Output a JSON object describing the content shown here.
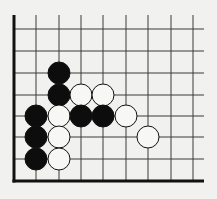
{
  "diagram": {
    "type": "go-board-corner",
    "background": "#f1f1ef",
    "line_color": "#3a3a3a",
    "border_color": "#111111",
    "grid": {
      "x_lines": [
        36,
        59,
        81,
        103,
        126,
        148,
        171,
        193
      ],
      "y_lines": [
        29,
        51,
        73,
        95,
        116,
        137,
        159
      ],
      "left_edge_x": 14,
      "bottom_edge_y": 181,
      "top_y": 15,
      "right_x": 204
    },
    "stone_radius": 11,
    "stones": [
      {
        "color": "black",
        "col": 2,
        "row": 3
      },
      {
        "color": "black",
        "col": 2,
        "row": 4
      },
      {
        "color": "white",
        "col": 3,
        "row": 4
      },
      {
        "color": "white",
        "col": 4,
        "row": 4
      },
      {
        "color": "black",
        "col": 1,
        "row": 5
      },
      {
        "color": "white",
        "col": 2,
        "row": 5
      },
      {
        "color": "black",
        "col": 3,
        "row": 5
      },
      {
        "color": "black",
        "col": 4,
        "row": 5
      },
      {
        "color": "white",
        "col": 5,
        "row": 5
      },
      {
        "color": "black",
        "col": 1,
        "row": 6
      },
      {
        "color": "white",
        "col": 2,
        "row": 6
      },
      {
        "color": "white",
        "col": 6,
        "row": 6
      },
      {
        "color": "black",
        "col": 1,
        "row": 7
      },
      {
        "color": "white",
        "col": 2,
        "row": 7
      }
    ]
  }
}
